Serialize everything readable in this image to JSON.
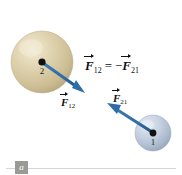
{
  "figure": {
    "panel_label": "a",
    "background_color": "#ffffff"
  },
  "equation": {
    "lhs_symbol": "F",
    "lhs_subscript": "12",
    "relation": "=",
    "sign": "−",
    "rhs_symbol": "F",
    "rhs_subscript": "21",
    "full_text": "F12 = -F21"
  },
  "bodies": [
    {
      "id": "sphere-2",
      "label": "2",
      "cx": 42,
      "cy": 62,
      "r": 31,
      "fill_color": "#d8cba6",
      "highlight_color": "#efe7cd",
      "shadow_color": "#b3a47c",
      "dot_color": "#111111"
    },
    {
      "id": "sphere-1",
      "label": "1",
      "cx": 153,
      "cy": 133,
      "r": 18,
      "fill_color": "#b9c5d6",
      "highlight_color": "#dde4ee",
      "shadow_color": "#8e9cb2",
      "dot_color": "#111111"
    }
  ],
  "vectors": [
    {
      "id": "F12",
      "symbol": "F",
      "subscript": "12",
      "color": "#2f6da6",
      "from_x": 42,
      "from_y": 62,
      "to_x": 84,
      "to_y": 92,
      "label_x": 62,
      "label_y": 96,
      "description": "force on body 1 from body 2, points down-right"
    },
    {
      "id": "F21",
      "symbol": "F",
      "subscript": "21",
      "color": "#2f6da6",
      "from_x": 153,
      "from_y": 133,
      "to_x": 108,
      "to_y": 104,
      "label_x": 113,
      "label_y": 94,
      "description": "force on body 2 from body 1, points up-left"
    }
  ],
  "colors": {
    "arrow_blue": "#2f6da6",
    "arrow_blue_dark": "#25557f",
    "sphere_tan": "#d8cba6",
    "sphere_blue": "#b9c5d6",
    "text_black": "#141414",
    "rule_gray": "#d6d6d2",
    "tag_gray": "#9a9a95"
  }
}
